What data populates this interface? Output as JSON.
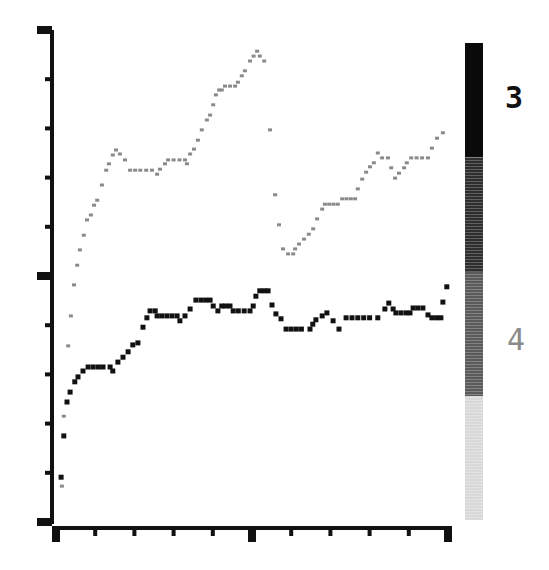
{
  "chart_data": {
    "type": "scatter",
    "title": "",
    "xlabel": "",
    "ylabel": "",
    "xlim": [
      0,
      10
    ],
    "ylim": [
      0,
      10
    ],
    "grid": false,
    "x_ticks": {
      "major": [
        0,
        5,
        10
      ],
      "minor": [
        1,
        2,
        3,
        4,
        6,
        7,
        8,
        9
      ]
    },
    "y_ticks": {
      "major": [
        0,
        5,
        10
      ],
      "minor": [
        1,
        2,
        3,
        4,
        6,
        7,
        8,
        9
      ]
    },
    "tick_labels_shown": false,
    "series": [
      {
        "name": "3",
        "color": "#111111",
        "marker": "square",
        "x": [
          0.13,
          0.2,
          0.28,
          0.36,
          0.48,
          0.56,
          0.69,
          0.82,
          0.95,
          1.08,
          1.2,
          1.38,
          1.45,
          1.58,
          1.71,
          1.84,
          1.96,
          2.09,
          2.22,
          2.32,
          2.4,
          2.53,
          2.58,
          2.7,
          2.83,
          2.96,
          3.09,
          3.16,
          3.29,
          3.42,
          3.57,
          3.7,
          3.82,
          3.93,
          4.01,
          4.13,
          4.23,
          4.33,
          4.44,
          4.52,
          4.65,
          4.8,
          4.95,
          5.03,
          5.1,
          5.2,
          5.31,
          5.41,
          5.51,
          5.61,
          5.74,
          5.87,
          6.0,
          6.13,
          6.26,
          6.48,
          6.55,
          6.63,
          6.79,
          6.91,
          7.07,
          7.22,
          7.4,
          7.55,
          7.7,
          7.85,
          8.0,
          8.21,
          8.39,
          8.49,
          8.6,
          8.67,
          8.8,
          8.93,
          9.03,
          9.11,
          9.23,
          9.36,
          9.49,
          9.59,
          9.71,
          9.82,
          9.87,
          9.97
        ],
        "y": [
          0.91,
          1.75,
          2.44,
          2.64,
          2.85,
          2.95,
          3.07,
          3.15,
          3.15,
          3.15,
          3.15,
          3.15,
          3.07,
          3.25,
          3.35,
          3.46,
          3.6,
          3.64,
          3.96,
          4.15,
          4.29,
          4.29,
          4.19,
          4.19,
          4.19,
          4.19,
          4.19,
          4.09,
          4.19,
          4.33,
          4.51,
          4.51,
          4.51,
          4.51,
          4.39,
          4.29,
          4.39,
          4.39,
          4.39,
          4.29,
          4.29,
          4.29,
          4.29,
          4.39,
          4.59,
          4.7,
          4.7,
          4.7,
          4.41,
          4.23,
          4.13,
          3.92,
          3.92,
          3.92,
          3.92,
          3.92,
          4.02,
          4.11,
          4.19,
          4.25,
          4.09,
          3.92,
          4.15,
          4.15,
          4.15,
          4.15,
          4.15,
          4.15,
          4.33,
          4.45,
          4.33,
          4.25,
          4.25,
          4.25,
          4.25,
          4.35,
          4.35,
          4.35,
          4.21,
          4.15,
          4.15,
          4.15,
          4.47,
          4.78
        ]
      },
      {
        "name": "4",
        "color": "#8a8a8a",
        "marker": "square",
        "x": [
          0.15,
          0.2,
          0.31,
          0.38,
          0.46,
          0.54,
          0.61,
          0.71,
          0.79,
          0.89,
          0.97,
          1.05,
          1.17,
          1.28,
          1.35,
          1.45,
          1.53,
          1.63,
          1.76,
          1.89,
          2.02,
          2.15,
          2.3,
          2.45,
          2.58,
          2.65,
          2.78,
          2.86,
          3.0,
          3.15,
          3.29,
          3.34,
          3.42,
          3.52,
          3.62,
          3.72,
          3.85,
          3.93,
          4.01,
          4.08,
          4.16,
          4.23,
          4.31,
          4.44,
          4.57,
          4.64,
          4.74,
          4.82,
          4.95,
          5.04,
          5.13,
          5.2,
          5.31,
          5.46,
          5.59,
          5.69,
          5.79,
          5.92,
          6.05,
          6.1,
          6.2,
          6.33,
          6.45,
          6.56,
          6.66,
          6.79,
          6.86,
          6.97,
          7.08,
          7.19,
          7.3,
          7.41,
          7.52,
          7.63,
          7.7,
          7.81,
          7.91,
          8.01,
          8.11,
          8.21,
          8.32,
          8.47,
          8.55,
          8.65,
          8.75,
          8.88,
          8.95,
          9.06,
          9.2,
          9.34,
          9.49,
          9.59,
          9.72,
          9.87
        ],
        "y": [
          0.73,
          2.15,
          3.58,
          4.19,
          4.82,
          5.22,
          5.53,
          5.83,
          6.14,
          6.24,
          6.44,
          6.54,
          6.85,
          7.15,
          7.28,
          7.46,
          7.56,
          7.48,
          7.36,
          7.15,
          7.15,
          7.15,
          7.15,
          7.15,
          7.07,
          7.17,
          7.28,
          7.36,
          7.36,
          7.36,
          7.36,
          7.28,
          7.48,
          7.58,
          7.76,
          7.97,
          8.17,
          8.27,
          8.48,
          8.68,
          8.78,
          8.78,
          8.86,
          8.86,
          8.86,
          8.94,
          9.07,
          9.17,
          9.37,
          9.47,
          9.57,
          9.47,
          9.37,
          7.97,
          6.65,
          6.04,
          5.55,
          5.45,
          5.45,
          5.55,
          5.65,
          5.75,
          5.85,
          5.96,
          6.16,
          6.36,
          6.46,
          6.46,
          6.46,
          6.46,
          6.57,
          6.57,
          6.57,
          6.57,
          6.77,
          6.97,
          7.11,
          7.22,
          7.3,
          7.5,
          7.4,
          7.4,
          7.2,
          6.99,
          7.09,
          7.2,
          7.3,
          7.4,
          7.4,
          7.4,
          7.4,
          7.6,
          7.8,
          7.91
        ]
      }
    ],
    "colorbar": {
      "labels": [
        {
          "text": "3",
          "color": "#111111"
        },
        {
          "text": "4",
          "color": "#8a8a8a"
        }
      ],
      "segments": [
        {
          "color": "#0a0a0a",
          "from": 1.0,
          "to": 0.76
        },
        {
          "color": "#2e2e2e",
          "from": 0.76,
          "to": 0.52
        },
        {
          "color": "#5a5a5a",
          "from": 0.52,
          "to": 0.26
        },
        {
          "color": "#d9d9d9",
          "from": 0.26,
          "to": 0.0
        }
      ]
    },
    "legend": "right"
  }
}
